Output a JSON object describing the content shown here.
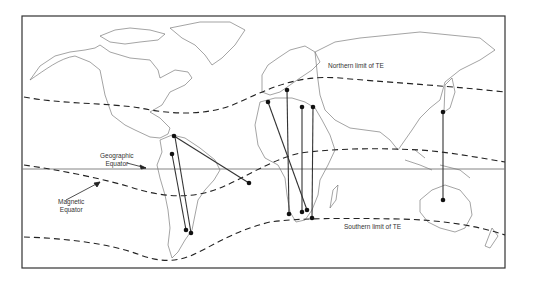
{
  "figure": {
    "labels": {
      "northern_limit": "Northern limit of TE",
      "southern_limit": "Southern limit of TE",
      "geographic_equator_line1": "Geographic",
      "geographic_equator_line2": "Equator",
      "magnetic_equator_line1": "Magnetic",
      "magnetic_equator_line2": "Equator"
    },
    "colors": {
      "frame": "#333333",
      "coastline": "#555555",
      "dashed_line": "#222222",
      "equator": "#777777",
      "link": "#333333",
      "station": "#111111"
    },
    "links": [
      {
        "from": [
          174,
          136
        ],
        "to": [
          249,
          183
        ]
      },
      {
        "from": [
          172,
          154
        ],
        "to": [
          186,
          230
        ]
      },
      {
        "from": [
          175,
          137
        ],
        "to": [
          191,
          233
        ]
      },
      {
        "from": [
          268,
          102
        ],
        "to": [
          307,
          210
        ]
      },
      {
        "from": [
          287,
          90
        ],
        "to": [
          289,
          214
        ]
      },
      {
        "from": [
          302,
          107
        ],
        "to": [
          302,
          212
        ]
      },
      {
        "from": [
          313,
          107
        ],
        "to": [
          312,
          218
        ]
      },
      {
        "from": [
          443,
          112
        ],
        "to": [
          443,
          200
        ]
      }
    ]
  }
}
